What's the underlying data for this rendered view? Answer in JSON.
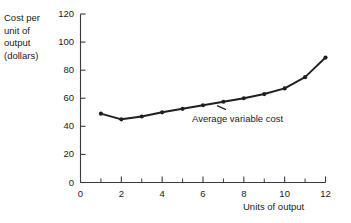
{
  "chart_data": {
    "type": "line",
    "title": "",
    "xlabel": "Units of output",
    "ylabel": "Cost per unit of output (dollars)",
    "ylabel_lines": [
      "Cost per",
      "unit of",
      "output",
      "(dollars)"
    ],
    "x": [
      1,
      2,
      3,
      4,
      5,
      6,
      7,
      8,
      9,
      10,
      11,
      12
    ],
    "values": [
      49,
      45,
      47,
      50,
      52.5,
      55,
      57.5,
      60,
      63,
      67,
      75,
      89
    ],
    "series": [
      {
        "name": "Average variable cost",
        "values": [
          49,
          45,
          47,
          50,
          52.5,
          55,
          57.5,
          60,
          63,
          67,
          75,
          89
        ]
      }
    ],
    "annotations": [
      {
        "text": "Average variable cost",
        "x": 7.2,
        "y": 51
      }
    ],
    "xlim": [
      0,
      12
    ],
    "ylim": [
      0,
      120
    ],
    "x_ticks_major": [
      0,
      2,
      4,
      6,
      8,
      10,
      12
    ],
    "x_ticks_minor": [
      1,
      3,
      5,
      7,
      9,
      11
    ],
    "x_tick_labels": [
      "0",
      "2",
      "4",
      "6",
      "8",
      "10",
      "12"
    ],
    "y_ticks": [
      0,
      20,
      40,
      60,
      80,
      100,
      120
    ],
    "y_tick_labels": [
      "0",
      "20",
      "40",
      "60",
      "80",
      "100",
      "120"
    ],
    "grid": false,
    "legend": "none",
    "line_color": "#1f1f1f",
    "marker": "circle",
    "background": "#ffffff"
  }
}
